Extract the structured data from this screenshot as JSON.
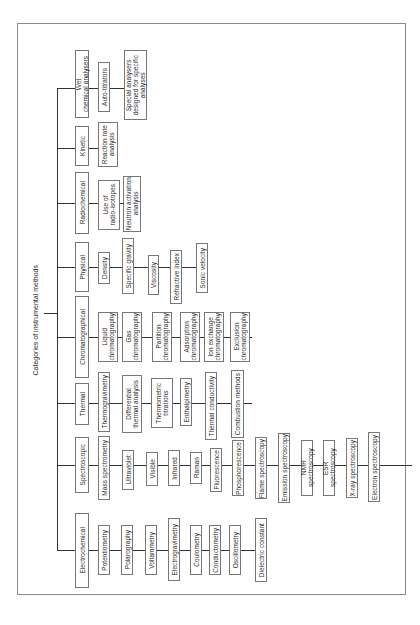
{
  "diagram": {
    "title": "Categories of instrumental methods",
    "categories": [
      {
        "label": "Wet\nchemical analysers",
        "children": [
          "Auto-titrators",
          "Special analysers\ndesigned for specific\nanalyses"
        ]
      },
      {
        "label": "Kinetic",
        "children": [
          "Reaction rate\nanalysis"
        ]
      },
      {
        "label": "Radiochemical",
        "children": [
          "Use of\nradio-isotopes",
          "Neutron activation\nanalysis"
        ]
      },
      {
        "label": "Physical",
        "children": [
          "Density",
          "Specific gravity",
          "Viscosity",
          "Refractive index",
          "Sonic velocity"
        ]
      },
      {
        "label": "Chromatographical",
        "children": [
          "Liquid\nchromatography",
          "Gas\nchromatography",
          "Partition\nchromatography",
          "Adsorption\nchromatography",
          "Ion exchange\nchromatography",
          "Exclusion\nchromatography"
        ]
      },
      {
        "label": "Thermal",
        "children": [
          "Thermogravimetry",
          "Differential\nthermal analysis",
          "Thermometric\ntitrations",
          "Enthalpimetry",
          "Thermal conductivity",
          "Combustion methods"
        ]
      },
      {
        "label": "Spectroscopic",
        "children": [
          "Mass spectrometry",
          "Ultraviolet",
          "Visible",
          "Infrared",
          "Raman",
          "Fluorescence",
          "Phosphorescence",
          "Flame spectroscopy",
          "Emission spectroscopy",
          "NMR spectroscopy",
          "ESR spectroscopy",
          "X-ray spectroscopy",
          "Electron spectroscopy"
        ]
      },
      {
        "label": "Electrochemical",
        "children": [
          "Potentiometry",
          "Polarography",
          "Voltammetry",
          "Electrogravimetry",
          "Coulometry",
          "Conductometry",
          "Oscillometry",
          "Dielectric constant"
        ]
      }
    ]
  }
}
